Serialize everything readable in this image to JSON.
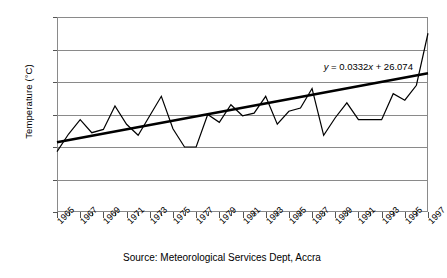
{
  "chart_data": {
    "type": "line",
    "title": "",
    "xlabel": "",
    "ylabel": "Temperature (°C)",
    "ylim": [
      25.0,
      28.0
    ],
    "xlim": [
      1965,
      1997
    ],
    "grid": true,
    "legend": "none",
    "ytick_labels": [
      "28.0",
      "27.5",
      "27.0",
      "26.5",
      "26.0",
      "25.5",
      "25.0"
    ],
    "ytick_values": [
      28.0,
      27.5,
      27.0,
      26.5,
      26.0,
      25.5,
      25.0
    ],
    "xtick_labels": [
      "1965",
      "1967",
      "1969",
      "1971",
      "1973",
      "1975",
      "1977",
      "1979",
      "1981",
      "1983",
      "1985",
      "1987",
      "1989",
      "1991",
      "1993",
      "1995",
      "1997"
    ],
    "xtick_values": [
      1965,
      1967,
      1969,
      1971,
      1973,
      1975,
      1977,
      1979,
      1981,
      1983,
      1985,
      1987,
      1989,
      1991,
      1993,
      1995,
      1997
    ],
    "x": [
      1965,
      1966,
      1967,
      1968,
      1969,
      1970,
      1971,
      1972,
      1973,
      1974,
      1975,
      1976,
      1977,
      1978,
      1979,
      1980,
      1981,
      1982,
      1983,
      1984,
      1985,
      1986,
      1987,
      1988,
      1989,
      1990,
      1991,
      1992,
      1993,
      1994,
      1995,
      1996,
      1997
    ],
    "series": [
      {
        "name": "Annual mean temperature",
        "values": [
          25.93,
          26.2,
          26.42,
          26.22,
          26.27,
          26.63,
          26.35,
          26.18,
          26.48,
          26.78,
          26.28,
          26.0,
          26.0,
          26.5,
          26.38,
          26.65,
          26.48,
          26.52,
          26.78,
          26.35,
          26.55,
          26.6,
          26.9,
          26.18,
          26.45,
          26.68,
          26.42,
          26.42,
          26.42,
          26.82,
          26.72,
          26.95,
          27.75
        ]
      }
    ],
    "trendline": {
      "equation": "y = 0.0332x + 26.074",
      "equation_parts": {
        "y": "y",
        "eq": " = 0.0332",
        "x": "x",
        "intercept": " + 26.074"
      },
      "slope": 0.0332,
      "intercept": 26.074,
      "start_value": 26.074,
      "end_value": 27.136
    },
    "annotations": [
      {
        "name": "trendline-equation",
        "text": "y = 0.0332x + 26.074"
      }
    ],
    "source_note": "Source: Meteorological Services Dept, Accra"
  },
  "colors": {
    "series": "#000000",
    "trendline": "#000000",
    "grid": "#8a8a8a",
    "axis": "#555555",
    "background": "#ffffff"
  }
}
